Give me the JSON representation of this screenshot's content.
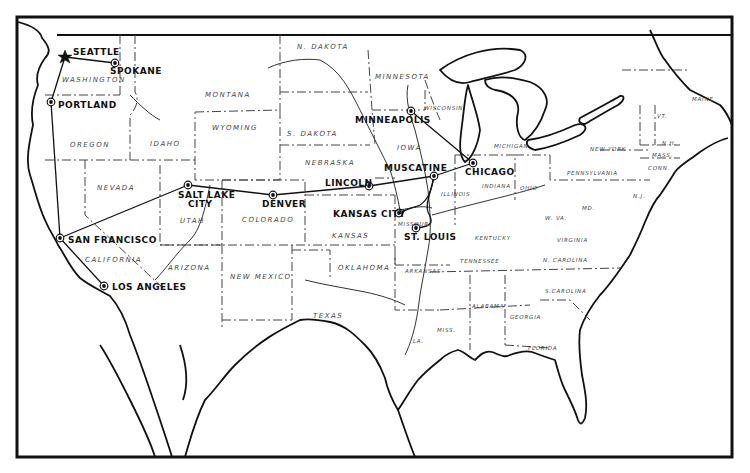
{
  "map": {
    "title": "United States route map",
    "colors": {
      "ink": "#111111",
      "border": "#444444",
      "background": "#ffffff"
    },
    "origin_city": "SEATTLE",
    "cities": [
      {
        "name": "SEATTLE",
        "marker": "star-icon"
      },
      {
        "name": "SPOKANE",
        "marker": "city-dot-icon"
      },
      {
        "name": "PORTLAND",
        "marker": "city-dot-icon"
      },
      {
        "name": "SAN FRANCISCO",
        "marker": "city-dot-icon"
      },
      {
        "name": "LOS ANGELES",
        "marker": "city-dot-icon"
      },
      {
        "name": "SALT LAKE",
        "name_line2": "CITY",
        "marker": "city-dot-icon"
      },
      {
        "name": "DENVER",
        "marker": "city-dot-icon"
      },
      {
        "name": "LINCOLN",
        "marker": "city-dot-icon"
      },
      {
        "name": "KANSAS CITY",
        "marker": "city-dot-icon"
      },
      {
        "name": "MUSCATINE",
        "marker": "city-dot-icon"
      },
      {
        "name": "ST. LOUIS",
        "marker": "city-dot-icon"
      },
      {
        "name": "MINNEAPOLIS",
        "marker": "city-dot-icon"
      },
      {
        "name": "CHICAGO",
        "marker": "city-dot-icon"
      }
    ],
    "routes": [
      [
        "SEATTLE",
        "SPOKANE"
      ],
      [
        "SEATTLE",
        "PORTLAND"
      ],
      [
        "PORTLAND",
        "SAN FRANCISCO"
      ],
      [
        "SAN FRANCISCO",
        "LOS ANGELES"
      ],
      [
        "SAN FRANCISCO",
        "SALT LAKE CITY"
      ],
      [
        "SALT LAKE CITY",
        "DENVER"
      ],
      [
        "DENVER",
        "LINCOLN"
      ],
      [
        "LINCOLN",
        "MUSCATINE"
      ],
      [
        "MUSCATINE",
        "CHICAGO"
      ],
      [
        "MINNEAPOLIS",
        "CHICAGO"
      ],
      [
        "MUSCATINE",
        "KANSAS CITY"
      ],
      [
        "MUSCATINE",
        "ST. LOUIS"
      ]
    ],
    "states": [
      "WASHINGTON",
      "OREGON",
      "IDAHO",
      "MONTANA",
      "WYOMING",
      "N. DAKOTA",
      "S. DAKOTA",
      "NEBRASKA",
      "NEVADA",
      "UTAH",
      "COLORADO",
      "CALIFORNIA",
      "ARIZONA",
      "NEW MEXICO",
      "KANSAS",
      "OKLAHOMA",
      "TEXAS",
      "MINNESOTA",
      "IOWA",
      "MISSOURI",
      "ARKANSAS",
      "LA.",
      "WISCONSIN",
      "ILLINOIS",
      "MICHIGAN",
      "INDIANA",
      "OHIO",
      "KENTUCKY",
      "TENNESSEE",
      "MISS.",
      "ALABAMA",
      "GEORGIA",
      "FLORIDA",
      "S.CAROLINA",
      "N. CAROLINA",
      "VIRGINIA",
      "W. VA.",
      "PENNSYLVANIA",
      "NEW YORK",
      "VT.",
      "N.H.",
      "MAINE",
      "MASS.",
      "CONN.",
      "N.J.",
      "MD."
    ]
  }
}
